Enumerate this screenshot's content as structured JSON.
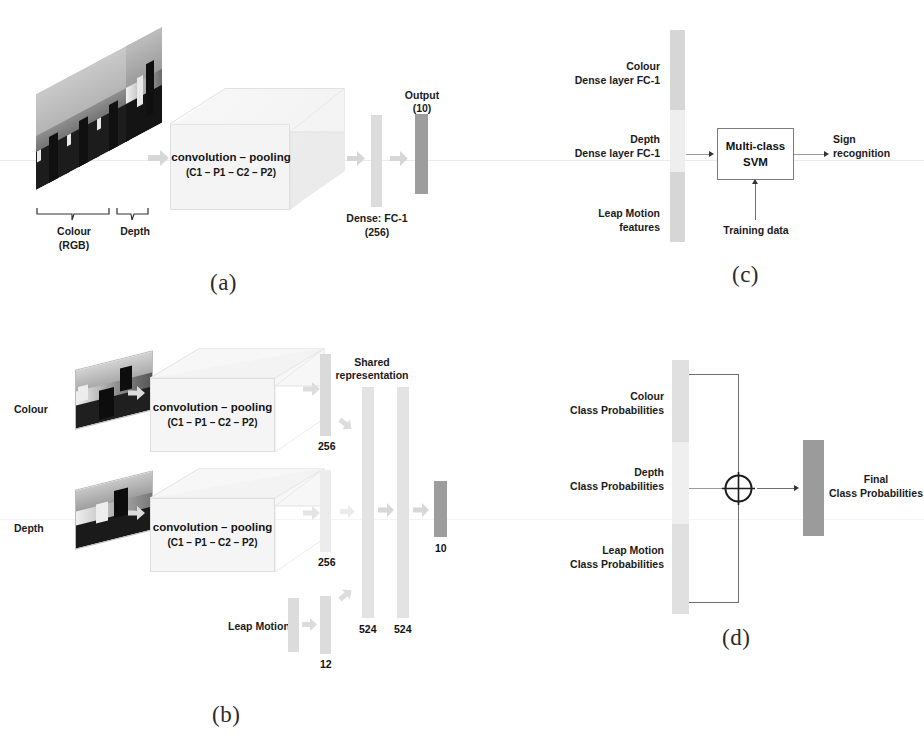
{
  "figure": {
    "background": "#ffffff",
    "accent_light": "#d9d9d9",
    "accent_dark": "#9e9e9e",
    "line_color": "#6f6f6f"
  },
  "panel_a": {
    "caption": "(a)",
    "input_label_colour": "Colour",
    "input_label_rgb": "(RGB)",
    "input_label_depth": "Depth",
    "cube_title": "convolution – pooling",
    "cube_subtitle": "(C1 – P1 – C2 – P2)",
    "dense_label": "Dense: FC-1",
    "dense_size": "(256)",
    "output_label": "Output",
    "output_size": "(10)"
  },
  "panel_b": {
    "caption": "(b)",
    "row_colour_label": "Colour",
    "row_depth_label": "Depth",
    "row_leap_label": "Leap Motion",
    "cube_title": "convolution – pooling",
    "cube_subtitle": "(C1 – P1 – C2 – P2)",
    "shared_label_line1": "Shared",
    "shared_label_line2": "representation",
    "size_colour_fc": "256",
    "size_depth_fc": "256",
    "size_leap_fc": "12",
    "size_shared_1": "524",
    "size_shared_2": "524",
    "size_output": "10"
  },
  "panel_c": {
    "caption": "(c)",
    "feature_colour_line1": "Colour",
    "feature_colour_line2": "Dense layer FC-1",
    "feature_depth_line1": "Depth",
    "feature_depth_line2": "Dense layer FC-1",
    "feature_leap_line1": "Leap Motion",
    "feature_leap_line2": "features",
    "svm_line1": "Multi-class",
    "svm_line2": "SVM",
    "training_label": "Training data",
    "output_line1": "Sign",
    "output_line2": "recognition"
  },
  "panel_d": {
    "caption": "(d)",
    "in_colour_line1": "Colour",
    "in_colour_line2": "Class Probabilities",
    "in_depth_line1": "Depth",
    "in_depth_line2": "Class Probabilities",
    "in_leap_line1": "Leap Motion",
    "in_leap_line2": "Class Probabilities",
    "operator": "⊕",
    "out_line1": "Final",
    "out_line2": "Class Probabilities"
  }
}
